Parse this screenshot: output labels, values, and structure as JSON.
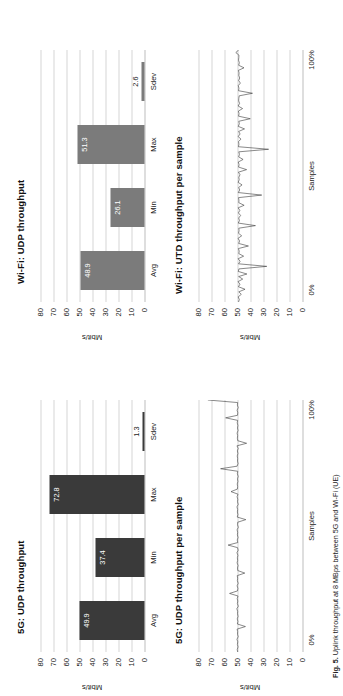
{
  "figure": {
    "caption_prefix": "Fig. 5.",
    "caption_text": "Uplink throughput at 8 MBps between 5G and Wi-Fi (UE)"
  },
  "axis": {
    "ylabel": "Mbit/s",
    "yticks": [
      "80",
      "70",
      "60",
      "50",
      "40",
      "30",
      "20",
      "10",
      "0"
    ],
    "ymin": 0,
    "ymax": 80,
    "bar_categories": [
      "Avg",
      "Min",
      "Max",
      "Sdev"
    ],
    "sample_xticks": [
      "0%",
      "Samples",
      "100%"
    ]
  },
  "colors": {
    "bar_5g": "#3a3a3a",
    "bar_wifi": "#7b7b7b",
    "grid": "#d6d6d6",
    "line": "#3a3a3a",
    "value_label": "#ffffff"
  },
  "chart_data": [
    {
      "id": "fiveg-udp-bars",
      "type": "bar",
      "title": "5G: UDP throughput",
      "ylabel": "Mbit/s",
      "xlabel": "",
      "ylim": [
        0,
        80
      ],
      "categories": [
        "Avg",
        "Min",
        "Max"
      ],
      "values": [
        49.9,
        37.4,
        72.8
      ],
      "value_labels": [
        "49.9",
        "37.4",
        "72.8"
      ],
      "extra_category": "Sdev",
      "extra_value": 1.3,
      "extra_value_label": "1.3",
      "grid": true,
      "legend": "none"
    },
    {
      "id": "fiveg-udp-samples",
      "type": "line",
      "title": "5G: UDP throughput per sample",
      "ylabel": "Mbit/s",
      "xlabel": "Samples",
      "ylim": [
        0,
        80
      ],
      "xlim_labels": [
        "0%",
        "100%"
      ],
      "grid": true,
      "series": [
        {
          "name": "5G UDP per sample",
          "values": [
            49.9,
            50.2,
            49.6,
            50.1,
            49.8,
            50.4,
            49.5,
            50.0,
            49.9,
            50.3,
            43.9,
            50.1,
            49.7,
            50.2,
            49.6,
            50.0,
            49.9,
            50.5,
            49.4,
            50.1,
            49.8,
            50.2,
            49.6,
            56.1,
            50.0,
            49.7,
            50.3,
            49.5,
            50.1,
            49.9,
            50.2,
            44.4,
            49.8,
            50.0,
            49.6,
            50.3,
            49.9,
            50.1,
            49.7,
            50.4,
            49.5,
            50.0,
            57.2,
            49.8,
            50.2,
            49.6,
            50.1,
            49.9,
            50.3,
            49.4,
            50.0,
            49.8,
            43.6,
            50.2,
            49.7,
            50.1,
            49.9,
            50.4,
            49.5,
            50.0,
            49.8,
            50.3,
            49.6,
            55.0,
            50.1,
            49.9,
            50.2,
            49.7,
            50.0,
            49.5,
            50.1,
            49.8,
            63.0,
            50.3,
            49.6,
            50.0,
            49.9,
            50.2,
            49.7,
            50.1,
            49.5,
            50.4,
            43.0,
            49.8,
            50.1,
            49.9,
            50.3,
            49.6,
            50.0,
            49.7,
            50.2,
            49.9,
            59.1,
            50.0,
            49.8,
            50.3,
            49.5,
            50.1,
            49.9,
            72.8
          ]
        }
      ]
    },
    {
      "id": "wifi-udp-bars",
      "type": "bar",
      "title": "Wi-Fi: UDP throughput",
      "ylabel": "Mbit/s",
      "xlabel": "",
      "ylim": [
        0,
        80
      ],
      "categories": [
        "Avg",
        "Min",
        "Max"
      ],
      "values": [
        48.9,
        26.1,
        51.3
      ],
      "value_labels": [
        "48.9",
        "26.1",
        "51.3"
      ],
      "extra_category": "Sdev",
      "extra_value": 2.6,
      "extra_value_label": "2.6",
      "grid": true,
      "legend": "none"
    },
    {
      "id": "wifi-utd-samples",
      "type": "line",
      "title": "Wi-Fi: UTD throughput per sample",
      "ylabel": "Mbit/s",
      "xlabel": "Samples",
      "ylim": [
        0,
        80
      ],
      "xlim_labels": [
        "0%",
        "100%"
      ],
      "grid": true,
      "series": [
        {
          "name": "Wi-Fi UTD per sample",
          "values": [
            49.2,
            48.6,
            49.5,
            47.1,
            49.0,
            44.2,
            49.3,
            48.1,
            49.6,
            46.0,
            49.1,
            42.8,
            49.4,
            48.9,
            27.5,
            49.2,
            48.0,
            49.5,
            45.3,
            49.0,
            48.7,
            49.3,
            41.6,
            49.1,
            48.4,
            49.6,
            46.8,
            49.2,
            48.8,
            49.0,
            36.2,
            49.4,
            48.5,
            49.1,
            47.6,
            49.3,
            48.2,
            49.5,
            44.9,
            49.0,
            48.9,
            49.2,
            31.4,
            49.4,
            48.3,
            49.1,
            46.5,
            49.5,
            48.7,
            49.0,
            48.1,
            49.3,
            43.0,
            49.2,
            48.8,
            49.4,
            45.7,
            49.1,
            48.5,
            49.0,
            26.1,
            49.3,
            48.9,
            49.2,
            47.3,
            49.5,
            48.0,
            49.1,
            44.6,
            49.4,
            48.6,
            49.0,
            40.2,
            49.2,
            48.8,
            49.3,
            46.1,
            49.5,
            48.4,
            49.1,
            49.0,
            48.7,
            38.5,
            49.2,
            48.9,
            49.4,
            47.8,
            49.1,
            48.3,
            49.0,
            48.8,
            49.3,
            45.0,
            49.1,
            48.6,
            49.2,
            49.0,
            48.9,
            51.3,
            49.1
          ]
        }
      ]
    }
  ]
}
